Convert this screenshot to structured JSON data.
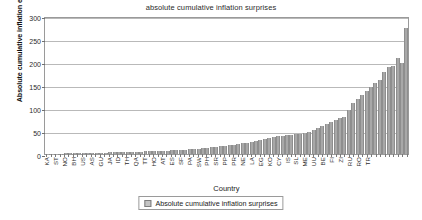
{
  "chart_data": {
    "type": "bar",
    "title": "absolute cumulative inflation surprises",
    "xlabel": "Country",
    "ylabel": "Absolute cumulative inflation errors",
    "ylim": [
      0,
      300
    ],
    "yticks": [
      0,
      50,
      100,
      150,
      200,
      250,
      300
    ],
    "grid": true,
    "legend_position": "bottom",
    "series_name": "Absolute cumulative inflation surprises",
    "bar_color": "#a8a8a8",
    "categories": [
      "KA",
      "SI",
      "ST",
      "MA",
      "NO",
      "NZ",
      "BH",
      "DE",
      "US",
      "CN",
      "AS",
      "SP",
      "GU",
      "CA",
      "JA",
      "MX",
      "ID",
      "FR",
      "TH",
      "IT",
      "QA",
      "BR",
      "TT",
      "AR",
      "HO",
      "CH",
      "AT",
      "KU",
      "ES",
      "DO",
      "SF",
      "NI",
      "PA",
      "TN",
      "SW",
      "MO",
      "PH",
      "GR",
      "SR",
      "JO",
      "PP",
      "BO",
      "PR",
      "PE",
      "NE",
      "VE",
      "LA",
      "CO",
      "EG",
      "BU",
      "KO",
      "AL",
      "CY",
      "LI",
      "IS",
      "UR",
      "SL",
      "PO",
      "ME",
      "HU",
      "UU",
      "CZ",
      "BE",
      "SK",
      "FI",
      "EC",
      "ZI",
      "UK",
      "RU",
      "AZ",
      "RO",
      "LT",
      "TR",
      "AN"
    ],
    "values": [
      0.4,
      0.6,
      0.8,
      1.0,
      1.2,
      1.4,
      1.6,
      1.8,
      2.0,
      2.2,
      2.4,
      2.7,
      2.9,
      3.1,
      3.4,
      3.6,
      3.9,
      4.1,
      4.4,
      4.7,
      5.0,
      5.3,
      5.6,
      6.0,
      6.4,
      6.8,
      7.2,
      7.6,
      8.0,
      8.5,
      9.0,
      9.6,
      10.2,
      11.0,
      11.8,
      12.6,
      13.5,
      14.5,
      15.5,
      16.6,
      17.8,
      19.0,
      20.5,
      22.0,
      23.5,
      25.0,
      27.0,
      29.0,
      31.0,
      33.0,
      35.0,
      37.0,
      38.5,
      40.0,
      41.0,
      42.0,
      43.0,
      44.0,
      46.0,
      48.0,
      52.0,
      56.0,
      60.0,
      66.0,
      70.0,
      75.0,
      78.0,
      80.0,
      95.0,
      110.0,
      120.0,
      128.0,
      137.0,
      146.0
    ],
    "labeled_ticks": [
      {
        "label": "KA",
        "index": 0
      },
      {
        "label": "ST",
        "index": 2
      },
      {
        "label": "NO",
        "index": 4
      },
      {
        "label": "BH",
        "index": 6
      },
      {
        "label": "US",
        "index": 8
      },
      {
        "label": "AS",
        "index": 10
      },
      {
        "label": "GU",
        "index": 12
      },
      {
        "label": "JA",
        "index": 14
      },
      {
        "label": "ID",
        "index": 16
      },
      {
        "label": "TH",
        "index": 18
      },
      {
        "label": "QA",
        "index": 20
      },
      {
        "label": "TT",
        "index": 22
      },
      {
        "label": "HO",
        "index": 24
      },
      {
        "label": "AT",
        "index": 26
      },
      {
        "label": "ES",
        "index": 28
      },
      {
        "label": "SF",
        "index": 30
      },
      {
        "label": "PA",
        "index": 32
      },
      {
        "label": "SW",
        "index": 34
      },
      {
        "label": "PH",
        "index": 36
      },
      {
        "label": "SR",
        "index": 38
      },
      {
        "label": "PP",
        "index": 40
      },
      {
        "label": "PR",
        "index": 42
      },
      {
        "label": "NE",
        "index": 44
      },
      {
        "label": "LA",
        "index": 46
      },
      {
        "label": "EG",
        "index": 48
      },
      {
        "label": "KO",
        "index": 50
      },
      {
        "label": "CY",
        "index": 52
      },
      {
        "label": "IS",
        "index": 54
      },
      {
        "label": "SL",
        "index": 56
      },
      {
        "label": "ME",
        "index": 58
      },
      {
        "label": "UU",
        "index": 60
      },
      {
        "label": "BE",
        "index": 62
      },
      {
        "label": "FI",
        "index": 64
      },
      {
        "label": "ZI",
        "index": 66
      },
      {
        "label": "RU",
        "index": 68
      },
      {
        "label": "RO",
        "index": 70
      },
      {
        "label": "TR",
        "index": 72
      }
    ],
    "extra_values": [
      155.0,
      160.0,
      178.0,
      190.0,
      192.0,
      208.0,
      198.0,
      275.0
    ]
  },
  "legend": {
    "label": "Absolute cumulative inflation surprises"
  }
}
